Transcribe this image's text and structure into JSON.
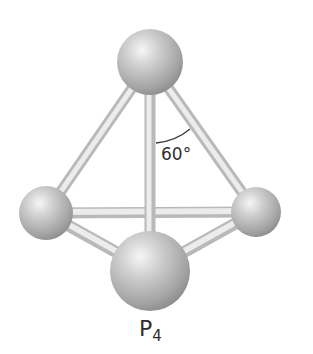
{
  "figure": {
    "molecule": "P4",
    "geometry": "tetrahedral",
    "formula_label": {
      "element": "P",
      "subscript": "4"
    },
    "angle_label": "60°",
    "atoms": [
      {
        "id": "top",
        "cx": 150,
        "cy": 62,
        "r": 33
      },
      {
        "id": "left",
        "cx": 46,
        "cy": 213,
        "r": 27
      },
      {
        "id": "right",
        "cx": 256,
        "cy": 212,
        "r": 25
      },
      {
        "id": "front",
        "cx": 150,
        "cy": 271,
        "r": 40
      }
    ],
    "bonds": [
      [
        "left",
        "right"
      ],
      [
        "top",
        "left"
      ],
      [
        "top",
        "right"
      ],
      [
        "left",
        "front"
      ],
      [
        "right",
        "front"
      ],
      [
        "top",
        "front"
      ]
    ],
    "colors": {
      "background": "#ffffff",
      "atom_highlight": "#f4f4f4",
      "atom_mid": "#bdbdbd",
      "atom_shadow": "#8e8e8e",
      "bond_light": "#ececec",
      "bond_edge": "#b9b9b9",
      "text": "#2e2e2e",
      "arc": "#3a3a3a"
    }
  }
}
